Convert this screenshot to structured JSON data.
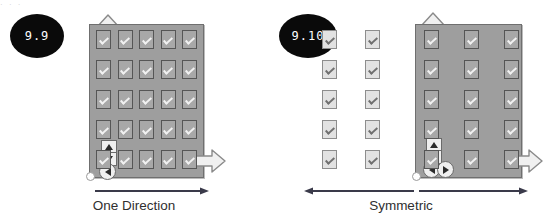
{
  "page": {
    "top_strip_text": "· · ·",
    "background": "#ffffff",
    "panel_color": "#9e9e9e",
    "badge_color": "#0a0a0a",
    "caption_color": "#2f2f2f"
  },
  "figures": [
    {
      "id": "one-direction",
      "badge": "9.9",
      "caption": "One Direction",
      "panel": {
        "columns": 5,
        "rows": 5
      },
      "outside_columns": 0,
      "grow_arrows": [
        "up",
        "right"
      ],
      "dpad_buttons": [
        "up",
        "down",
        "left"
      ],
      "measure_arrows": [
        "right"
      ],
      "origin_label": "origin"
    },
    {
      "id": "symmetric",
      "badge": "9.10",
      "caption": "Symmetric",
      "panel": {
        "columns": 3,
        "rows": 5
      },
      "outside_columns": 2,
      "grow_arrows": [
        "up",
        "right"
      ],
      "dpad_buttons": [
        "up",
        "down",
        "left",
        "right"
      ],
      "measure_arrows": [
        "left",
        "right"
      ],
      "origin_label": "origin"
    }
  ],
  "icons": {
    "checkbox": "checkbox-checked-icon",
    "arrow_up": "arrow-up-icon",
    "arrow_right": "arrow-right-icon",
    "arrow_left": "arrow-left-icon",
    "arrow_down": "arrow-down-icon",
    "origin": "origin-marker-icon"
  }
}
